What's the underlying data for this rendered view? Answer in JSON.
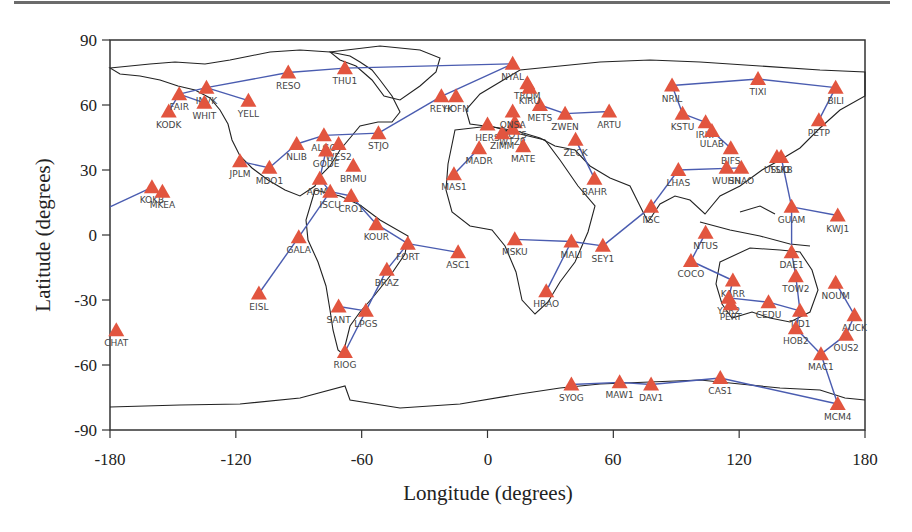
{
  "chart_data": {
    "type": "scatter",
    "title": "",
    "xlabel": "Longitude  (degrees)",
    "ylabel": "Latitude  (degrees)",
    "xlim": [
      -180,
      180
    ],
    "ylim": [
      -90,
      90
    ],
    "xticks": [
      -180,
      -120,
      -60,
      0,
      60,
      120,
      180
    ],
    "yticks": [
      90,
      60,
      30,
      0,
      -30,
      -60,
      -90
    ],
    "grid": false,
    "marker": "triangle",
    "marker_color": "#e2553f",
    "link_color": "#4a5cb0",
    "coast_color": "#222222",
    "stations": [
      {
        "name": "KODK",
        "lon": -152,
        "lat": 57
      },
      {
        "name": "FAIR",
        "lon": -147,
        "lat": 65
      },
      {
        "name": "INVK",
        "lon": -134,
        "lat": 68
      },
      {
        "name": "WHIT",
        "lon": -135,
        "lat": 61
      },
      {
        "name": "YELL",
        "lon": -114,
        "lat": 62
      },
      {
        "name": "RESO",
        "lon": -95,
        "lat": 75
      },
      {
        "name": "THU1",
        "lon": -68,
        "lat": 77
      },
      {
        "name": "NYAL",
        "lon": 12,
        "lat": 79
      },
      {
        "name": "REYK",
        "lon": -22,
        "lat": 64
      },
      {
        "name": "HOFN",
        "lon": -15,
        "lat": 64
      },
      {
        "name": "STJO",
        "lon": -52,
        "lat": 47
      },
      {
        "name": "NLIB",
        "lon": -91,
        "lat": 42
      },
      {
        "name": "ALGO",
        "lon": -78,
        "lat": 46
      },
      {
        "name": "WES2",
        "lon": -71,
        "lat": 42
      },
      {
        "name": "GODE",
        "lon": -77,
        "lat": 39
      },
      {
        "name": "BRMU",
        "lon": -64,
        "lat": 32
      },
      {
        "name": "JPLM",
        "lon": -118,
        "lat": 34
      },
      {
        "name": "MDO1",
        "lon": -104,
        "lat": 31
      },
      {
        "name": "AOML",
        "lon": -80,
        "lat": 26
      },
      {
        "name": "CRO1",
        "lon": -65,
        "lat": 18
      },
      {
        "name": "ISCU",
        "lon": -75,
        "lat": 20
      },
      {
        "name": "KOKB",
        "lon": -160,
        "lat": 22
      },
      {
        "name": "MKEA",
        "lon": -155,
        "lat": 20
      },
      {
        "name": "KOUR",
        "lon": -53,
        "lat": 5
      },
      {
        "name": "GALA",
        "lon": -90,
        "lat": -1
      },
      {
        "name": "FORT",
        "lon": -38,
        "lat": -4
      },
      {
        "name": "ASC1",
        "lon": -14,
        "lat": -8
      },
      {
        "name": "BRAZ",
        "lon": -48,
        "lat": -16
      },
      {
        "name": "EISL",
        "lon": -109,
        "lat": -27
      },
      {
        "name": "SANT",
        "lon": -71,
        "lat": -33
      },
      {
        "name": "LPGS",
        "lon": -58,
        "lat": -35
      },
      {
        "name": "RIOG",
        "lon": -68,
        "lat": -54
      },
      {
        "name": "MAS1",
        "lon": -16,
        "lat": 28
      },
      {
        "name": "MADR",
        "lon": -4,
        "lat": 40
      },
      {
        "name": "HERS",
        "lon": 0,
        "lat": 51
      },
      {
        "name": "POTS",
        "lon": 13,
        "lat": 52
      },
      {
        "name": "WTZR",
        "lon": 12,
        "lat": 49
      },
      {
        "name": "ZIMM",
        "lon": 7,
        "lat": 47
      },
      {
        "name": "MATE",
        "lon": 17,
        "lat": 41
      },
      {
        "name": "ONSA",
        "lon": 12,
        "lat": 57
      },
      {
        "name": "METS",
        "lon": 25,
        "lat": 60
      },
      {
        "name": "TROM",
        "lon": 19,
        "lat": 70
      },
      {
        "name": "KIRU",
        "lon": 20,
        "lat": 68
      },
      {
        "name": "ZWEN",
        "lon": 37,
        "lat": 56
      },
      {
        "name": "ARTU",
        "lon": 58,
        "lat": 57
      },
      {
        "name": "ZECK",
        "lon": 42,
        "lat": 44
      },
      {
        "name": "BAHR",
        "lon": 51,
        "lat": 26
      },
      {
        "name": "MSKU",
        "lon": 13,
        "lat": -2
      },
      {
        "name": "MALI",
        "lon": 40,
        "lat": -3
      },
      {
        "name": "SEY1",
        "lon": 55,
        "lat": -5
      },
      {
        "name": "HRAO",
        "lon": 28,
        "lat": -26
      },
      {
        "name": "IISC",
        "lon": 78,
        "lat": 13
      },
      {
        "name": "LHAS",
        "lon": 91,
        "lat": 30
      },
      {
        "name": "NRIL",
        "lon": 88,
        "lat": 69
      },
      {
        "name": "TIXI",
        "lon": 129,
        "lat": 72
      },
      {
        "name": "BILI",
        "lon": 166,
        "lat": 68
      },
      {
        "name": "KSTU",
        "lon": 93,
        "lat": 56
      },
      {
        "name": "IRKT",
        "lon": 104,
        "lat": 52
      },
      {
        "name": "ULAB",
        "lon": 107,
        "lat": 48
      },
      {
        "name": "PETP",
        "lon": 158,
        "lat": 53
      },
      {
        "name": "BJFS",
        "lon": 116,
        "lat": 40
      },
      {
        "name": "WUHN",
        "lon": 114,
        "lat": 31
      },
      {
        "name": "SHAO",
        "lon": 121,
        "lat": 31
      },
      {
        "name": "TSKB",
        "lon": 140,
        "lat": 36
      },
      {
        "name": "USUD",
        "lon": 138,
        "lat": 36
      },
      {
        "name": "GUAM",
        "lon": 145,
        "lat": 13
      },
      {
        "name": "KWJ1",
        "lon": 167,
        "lat": 9
      },
      {
        "name": "NTUS",
        "lon": 104,
        "lat": 1
      },
      {
        "name": "COCO",
        "lon": 97,
        "lat": -12
      },
      {
        "name": "DAE1",
        "lon": 145,
        "lat": -8
      },
      {
        "name": "KARR",
        "lon": 117,
        "lat": -21
      },
      {
        "name": "TOW2",
        "lon": 147,
        "lat": -19
      },
      {
        "name": "NOUM",
        "lon": 166,
        "lat": -22
      },
      {
        "name": "YAR2",
        "lon": 115,
        "lat": -29
      },
      {
        "name": "PERT",
        "lon": 116,
        "lat": -32
      },
      {
        "name": "CEDU",
        "lon": 134,
        "lat": -31
      },
      {
        "name": "TID1",
        "lon": 149,
        "lat": -35
      },
      {
        "name": "AUCK",
        "lon": 175,
        "lat": -37
      },
      {
        "name": "HOB2",
        "lon": 147,
        "lat": -43
      },
      {
        "name": "CHAT",
        "lon": -177,
        "lat": -44
      },
      {
        "name": "OUS2",
        "lon": 171,
        "lat": -46
      },
      {
        "name": "MAC1",
        "lon": 159,
        "lat": -55
      },
      {
        "name": "SYOG",
        "lon": 40,
        "lat": -69
      },
      {
        "name": "MAW1",
        "lon": 63,
        "lat": -68
      },
      {
        "name": "DAV1",
        "lon": 78,
        "lat": -69
      },
      {
        "name": "CAS1",
        "lon": 111,
        "lat": -66
      },
      {
        "name": "MCM4",
        "lon": 167,
        "lat": -78
      }
    ],
    "links": [
      [
        "KODK",
        "FAIR"
      ],
      [
        "FAIR",
        "INVK"
      ],
      [
        "INVK",
        "YELL"
      ],
      [
        "FAIR",
        "WHIT"
      ],
      [
        "INVK",
        "RESO"
      ],
      [
        "RESO",
        "THU1"
      ],
      [
        "THU1",
        "NYAL"
      ],
      [
        "STJO",
        "REYK"
      ],
      [
        "REYK",
        "NYAL"
      ],
      [
        "STJO",
        "ALGO"
      ],
      [
        "NLIB",
        "ALGO"
      ],
      [
        "NLIB",
        "MDO1"
      ],
      [
        "MDO1",
        "JPLM"
      ],
      [
        "GODE",
        "AOML"
      ],
      [
        "AOML",
        "ISCU"
      ],
      [
        "ISCU",
        "CRO1"
      ],
      [
        "ISCU",
        "GALA"
      ],
      [
        "GALA",
        "EISL"
      ],
      [
        "CRO1",
        "KOUR"
      ],
      [
        "KOUR",
        "FORT"
      ],
      [
        "FORT",
        "ASC1"
      ],
      [
        "FORT",
        "BRAZ"
      ],
      [
        "BRAZ",
        "LPGS"
      ],
      [
        "LPGS",
        "SANT"
      ],
      [
        "LPGS",
        "RIOG"
      ],
      [
        "MAS1",
        "MADR"
      ],
      [
        "METS",
        "ZWEN"
      ],
      [
        "ZWEN",
        "ARTU"
      ],
      [
        "ZECK",
        "BAHR"
      ],
      [
        "MSKU",
        "MALI"
      ],
      [
        "MALI",
        "SEY1"
      ],
      [
        "MALI",
        "HRAO"
      ],
      [
        "SEY1",
        "IISC"
      ],
      [
        "IISC",
        "LHAS"
      ],
      [
        "LHAS",
        "SHAO"
      ],
      [
        "NRIL",
        "TIXI"
      ],
      [
        "TIXI",
        "BILI"
      ],
      [
        "NRIL",
        "KSTU"
      ],
      [
        "KSTU",
        "IRKT"
      ],
      [
        "IRKT",
        "ULAB"
      ],
      [
        "ULAB",
        "BJFS"
      ],
      [
        "BILI",
        "PETP"
      ],
      [
        "TSKB",
        "GUAM"
      ],
      [
        "GUAM",
        "KWJ1"
      ],
      [
        "GUAM",
        "DAE1"
      ],
      [
        "DAE1",
        "TOW2"
      ],
      [
        "TOW2",
        "TID1"
      ],
      [
        "NTUS",
        "COCO"
      ],
      [
        "COCO",
        "KARR"
      ],
      [
        "KARR",
        "YAR2"
      ],
      [
        "YAR2",
        "CEDU"
      ],
      [
        "CEDU",
        "TID1"
      ],
      [
        "TID1",
        "HOB2"
      ],
      [
        "HOB2",
        "MAC1"
      ],
      [
        "MAC1",
        "OUS2"
      ],
      [
        "OUS2",
        "AUCK"
      ],
      [
        "AUCK",
        "NOUM"
      ],
      [
        "MAC1",
        "MCM4"
      ],
      [
        "SYOG",
        "MAW1"
      ],
      [
        "MAW1",
        "DAV1"
      ],
      [
        "DAV1",
        "CAS1"
      ],
      [
        "CAS1",
        "MCM4"
      ]
    ]
  },
  "axes": {
    "x_title": "Longitude  (degrees)",
    "y_title": "Latitude  (degrees)",
    "x_tick_labels": [
      "-180",
      "-120",
      "-60",
      "0",
      "60",
      "120",
      "180"
    ],
    "y_tick_labels": [
      "90",
      "60",
      "30",
      "0",
      "-30",
      "-60",
      "-90"
    ]
  }
}
